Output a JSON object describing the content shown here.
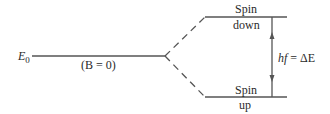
{
  "diagram": {
    "unperturbed_level": {
      "symbol": "E",
      "subscript": "0",
      "condition": "(B = 0)"
    },
    "upper_level": {
      "line1": "Spin",
      "line2": "down"
    },
    "lower_level": {
      "line1": "Spin",
      "line2": "up"
    },
    "transition": {
      "label_h": "hf",
      "label_eq": " = ΔE"
    },
    "colors": {
      "line": "#555555",
      "text": "#2a2a2a"
    }
  }
}
